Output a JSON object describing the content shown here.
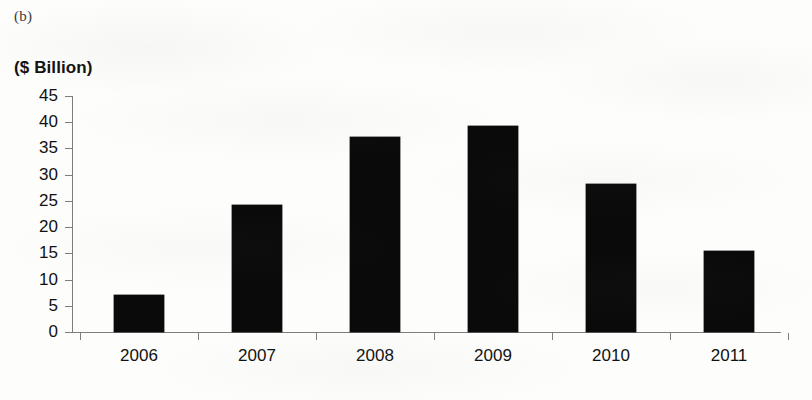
{
  "figure": {
    "caption": "(b)",
    "unit_label": "($ Billion)"
  },
  "chart_data": {
    "type": "bar",
    "title": "",
    "subtitle": "",
    "xlabel": "",
    "ylabel": "($ Billion)",
    "categories": [
      "2006",
      "2007",
      "2008",
      "2009",
      "2010",
      "2011"
    ],
    "values": [
      7.0,
      24.3,
      37.2,
      39.3,
      28.2,
      15.4
    ],
    "series": [
      {
        "name": "",
        "values": [
          7.0,
          24.3,
          37.2,
          39.3,
          28.2,
          15.4
        ]
      }
    ],
    "ylim": [
      0,
      45
    ],
    "ytick_values": [
      0,
      5,
      10,
      15,
      20,
      25,
      30,
      35,
      40,
      45
    ],
    "ytick_labels": [
      "0",
      "5",
      "10",
      "15",
      "20",
      "25",
      "30",
      "35",
      "40",
      "45"
    ],
    "grid": false,
    "legend": false,
    "legend_position": "none",
    "bar_color": "#0a0a0a",
    "axis_color": "#7d7d7d"
  }
}
